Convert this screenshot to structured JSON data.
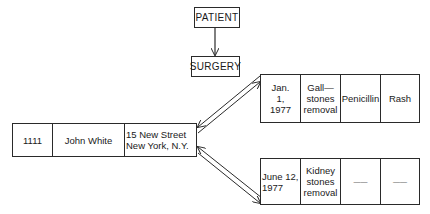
{
  "schema": {
    "parent": "PATIENT",
    "child": "SURGERY"
  },
  "patient_record": {
    "cells": [
      "1111",
      "John White",
      "15 New Street\nNew York, N.Y."
    ]
  },
  "surgery_records": [
    {
      "cells": [
        "Jan.\n1,\n1977",
        "Gall—\nstones\nremoval",
        "Penicillin",
        "Rash"
      ]
    },
    {
      "cells": [
        "June 12,\n1977",
        "Kidney\nstones\nremoval",
        "——",
        "——"
      ]
    }
  ],
  "colors": {
    "line": "#2a2a2a",
    "background": "#ffffff"
  }
}
